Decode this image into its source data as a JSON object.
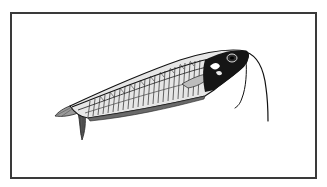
{
  "image": {
    "subject": "Glass catfish illustration",
    "style": "black-and-white engraving",
    "background": "#ffffff",
    "frame_color": "#3a3a3a",
    "ink_color": "#111111"
  },
  "frame": {
    "x": 10,
    "y": 12,
    "width": 307,
    "height": 167
  },
  "illustration": {
    "elements": [
      {
        "name": "fish-body",
        "description": "translucent elongated catfish body with visible ribs"
      },
      {
        "name": "head",
        "description": "dark head with eye"
      },
      {
        "name": "barbels",
        "count": 2
      },
      {
        "name": "caudal-fin",
        "description": "forked tail fin at left"
      },
      {
        "name": "anal-fin",
        "description": "long fin along underside"
      },
      {
        "name": "pectoral-fin",
        "description": "small fin behind head"
      }
    ]
  }
}
